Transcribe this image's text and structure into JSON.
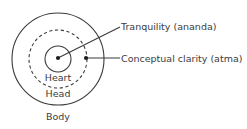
{
  "diagram": {
    "background_color": "#ffffff",
    "stroke_color": "#3b3b3b",
    "text_color": "#3b3b3b",
    "rings": [
      {
        "id": "body",
        "label": "Body",
        "style": "solid",
        "center": {
          "x": 58,
          "y": 59
        },
        "radius": 46
      },
      {
        "id": "head",
        "label": "Head",
        "style": "dashed",
        "center": {
          "x": 58,
          "y": 59
        },
        "radius": 29
      },
      {
        "id": "heart",
        "label": "Heart",
        "style": "solid",
        "center": {
          "x": 58,
          "y": 59
        },
        "radius": 13
      }
    ],
    "callouts": [
      {
        "id": "tranquility",
        "label": "Tranquility (ananda)",
        "anchor_point": {
          "x": 58,
          "y": 58
        },
        "leader_end": {
          "x": 120,
          "y": 27
        },
        "leader_style": "diagonal"
      },
      {
        "id": "clarity",
        "label": "Conceptual clarity (atma)",
        "anchor_point": {
          "x": 86,
          "y": 58
        },
        "leader_end": {
          "x": 120,
          "y": 58
        },
        "leader_style": "horizontal"
      }
    ]
  }
}
